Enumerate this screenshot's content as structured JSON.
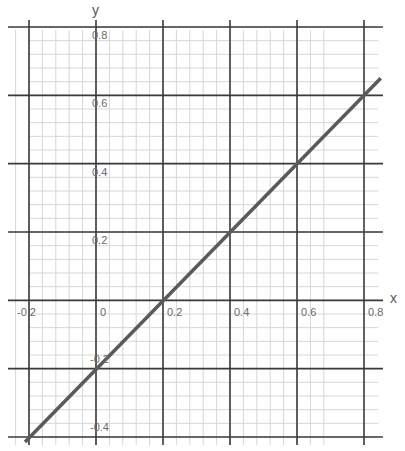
{
  "chart_data": {
    "type": "line",
    "title": "",
    "xlabel": "x",
    "ylabel": "y",
    "xlim": [
      -0.2,
      0.85
    ],
    "ylim": [
      -0.4,
      0.8
    ],
    "grid": true,
    "major_step": 0.2,
    "minor_step": 0.04,
    "x_ticks": [
      "-0.2",
      "0",
      "0.2",
      "0.4",
      "0.6",
      "0.8"
    ],
    "y_ticks": [
      "0.8",
      "0.6",
      "0.4",
      "0.2",
      "-0.2",
      "-0.4"
    ],
    "series": [
      {
        "name": "y = x - 0.2",
        "x": [
          -0.2,
          0.0,
          0.2,
          0.4,
          0.6,
          0.8,
          0.85
        ],
        "y": [
          -0.4,
          -0.2,
          0.0,
          0.2,
          0.4,
          0.6,
          0.65
        ]
      }
    ],
    "legend": "none"
  },
  "colors": {
    "major_grid": "#3a3a3a",
    "minor_grid": "#d6d6d6",
    "line": "#5a5a5a",
    "text": "#6a6a6a"
  }
}
